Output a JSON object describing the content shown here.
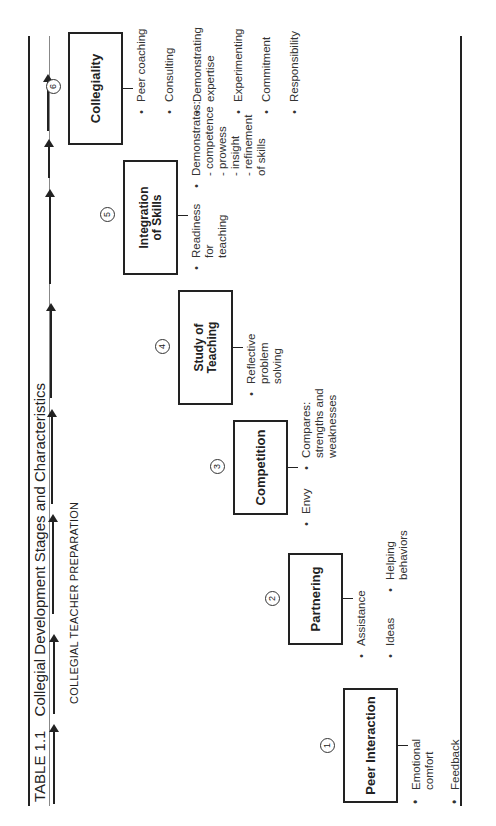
{
  "table": {
    "number": "TABLE 1.1",
    "title": "Collegial Development Stages and Characteristics",
    "subtitle": "COLLEGIAL TEACHER PREPARATION"
  },
  "stages": [
    {
      "number": "1",
      "label": "Peer Interaction",
      "characteristics": [
        "Emotional comfort",
        "Feedback"
      ]
    },
    {
      "number": "2",
      "label": "Partnering",
      "characteristics": [
        "Assistance",
        "Ideas",
        "Helping behaviors"
      ]
    },
    {
      "number": "3",
      "label": "Competition",
      "characteristics": [
        "Envy",
        "Compares: strengths and weaknesses"
      ]
    },
    {
      "number": "4",
      "label": "Study of Teaching",
      "characteristics": [
        "Reflective problem solving"
      ]
    },
    {
      "number": "5",
      "label": "Integration of Skills",
      "characteristics": [
        "Readiness for teaching",
        "Demonstrates:"
      ],
      "sub_characteristics": [
        "- competence",
        "- prowess",
        "- insight",
        "- refinement of skills"
      ]
    },
    {
      "number": "6",
      "label": "Collegiality",
      "characteristics": [
        "Peer coaching",
        "Consulting",
        "Demonstrating expertise",
        "Experimenting",
        "Commitment",
        "Responsibility"
      ]
    }
  ],
  "arrow_count": 8,
  "colors": {
    "ink": "#222222",
    "rule_thin": "#888888",
    "background": "#ffffff"
  }
}
